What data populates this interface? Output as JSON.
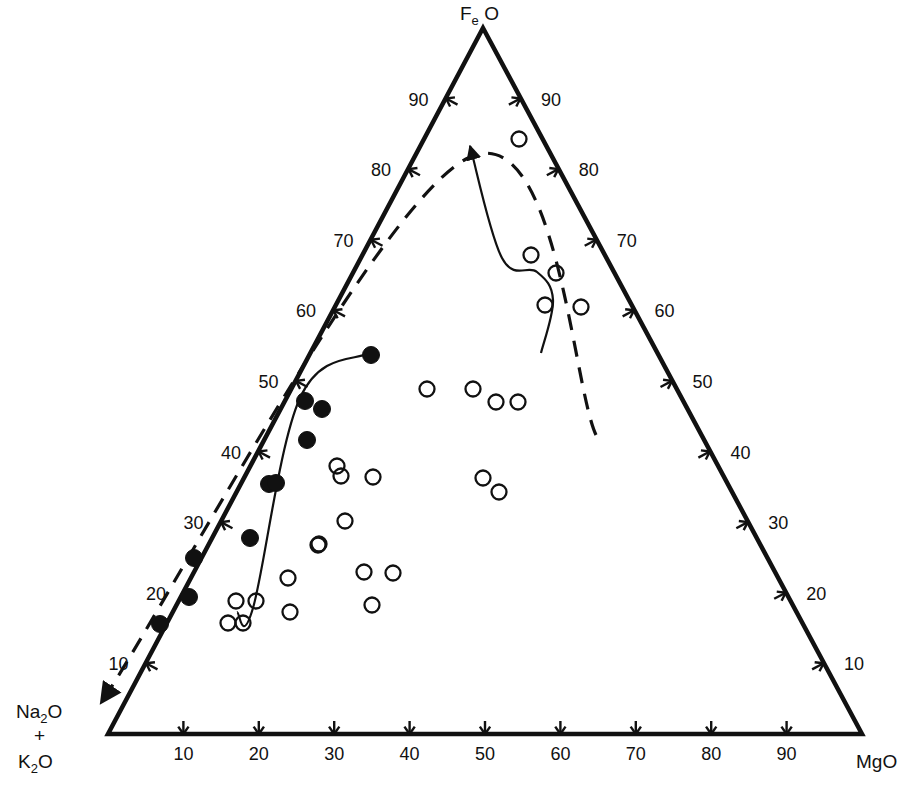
{
  "figure": {
    "type": "ternary-diagram",
    "background": "#ffffff",
    "line_color": "#111111"
  },
  "apexes": {
    "top": {
      "name": "FeO",
      "main1": "F",
      "sub": "e",
      "main2": "O",
      "display": "Fe O"
    },
    "bottom_left": {
      "line1_main": "Na",
      "line1_sub": "2",
      "line1_tail": "O",
      "line2": "+",
      "line3_main": "K",
      "line3_sub": "2",
      "line3_tail": "O",
      "display": "Na2O + K2O"
    },
    "bottom_right": {
      "name": "MgO",
      "display": "MgO"
    }
  },
  "axes": {
    "bottom": {
      "label": "MgO",
      "ticks": [
        "10",
        "20",
        "30",
        "40",
        "50",
        "60",
        "70",
        "80",
        "90"
      ],
      "tick_style": "v-arrow-down"
    },
    "left": {
      "label": "FeO",
      "ticks": [
        "10",
        "20",
        "30",
        "40",
        "50",
        "60",
        "70",
        "80",
        "90"
      ],
      "tick_style": "arrow-down-left"
    },
    "right": {
      "label": "MgO",
      "ticks": [
        "10",
        "20",
        "30",
        "40",
        "50",
        "60",
        "70",
        "80",
        "90"
      ],
      "tick_style": "arrow-up-right"
    }
  },
  "legend_symbols": {
    "filled_circle": "closed-circle-series",
    "open_circle": "open-circle-series"
  },
  "chart_data": {
    "type": "scatter",
    "title": "",
    "xlabel": "",
    "ylabel": "",
    "ternary": true,
    "corners": [
      "FeO",
      "Na2O+K2O",
      "MgO"
    ],
    "axis_ranges": {
      "min": 0,
      "max": 100,
      "tick_step": 10
    },
    "grid": false,
    "legend": "none",
    "series": [
      {
        "name": "closed-circle-series",
        "marker": "filled-circle",
        "points_px": [
          [
            371,
            355
          ],
          [
            305,
            401
          ],
          [
            322,
            409
          ],
          [
            307,
            440
          ],
          [
            269,
            484
          ],
          [
            276,
            483
          ],
          [
            250,
            538
          ],
          [
            194,
            558
          ],
          [
            189,
            597
          ],
          [
            160,
            624
          ]
        ]
      },
      {
        "name": "open-circle-series",
        "marker": "open-circle",
        "points_px": [
          [
            519,
            139
          ],
          [
            531,
            255
          ],
          [
            556,
            273
          ],
          [
            545,
            305
          ],
          [
            581,
            307
          ],
          [
            427,
            389
          ],
          [
            473,
            389
          ],
          [
            496,
            402
          ],
          [
            518,
            402
          ],
          [
            337,
            466
          ],
          [
            341,
            476
          ],
          [
            373,
            477
          ],
          [
            483,
            478
          ],
          [
            499,
            492
          ],
          [
            345,
            521
          ],
          [
            318,
            545
          ],
          [
            319,
            544
          ],
          [
            288,
            578
          ],
          [
            364,
            572
          ],
          [
            393,
            573
          ],
          [
            236,
            601
          ],
          [
            256,
            601
          ],
          [
            290,
            612
          ],
          [
            228,
            623
          ],
          [
            243,
            623
          ],
          [
            372,
            605
          ]
        ]
      }
    ],
    "annotations": [
      {
        "name": "dashed-trend-line",
        "style": "dashed",
        "arrow": "end",
        "path_px": [
          [
            596,
            435
          ],
          [
            466,
            159
          ],
          [
            101,
            703
          ]
        ]
      },
      {
        "name": "solid-trend-arrow",
        "style": "solid",
        "arrow": "end",
        "path_px": [
          [
            541,
            353
          ],
          [
            553,
            300
          ],
          [
            537,
            272
          ],
          [
            502,
            258
          ],
          [
            470,
            146
          ]
        ]
      },
      {
        "name": "solid-field-boundary",
        "style": "solid",
        "arrow": "none",
        "path_px": [
          [
            369,
            353
          ],
          [
            300,
            398
          ],
          [
            253,
            608
          ],
          [
            237,
            612
          ]
        ]
      }
    ]
  }
}
